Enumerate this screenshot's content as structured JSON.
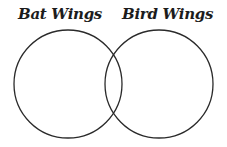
{
  "diagram": {
    "type": "venn",
    "sets": [
      {
        "label": "Bat Wings",
        "cx": 68,
        "cy": 84,
        "r": 54
      },
      {
        "label": "Bird Wings",
        "cx": 159,
        "cy": 84,
        "r": 54
      }
    ],
    "stroke_color": "#2a2a2a",
    "background": "#ffffff"
  }
}
